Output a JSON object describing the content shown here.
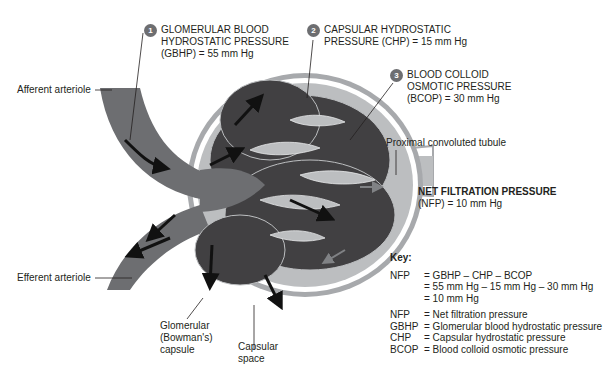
{
  "pressures": {
    "gbhp": {
      "number": "1",
      "lines": [
        "GLOMERULAR BLOOD",
        "HYDROSTATIC PRESSURE",
        "(GBHP) = 55 mm Hg"
      ]
    },
    "chp": {
      "number": "2",
      "lines": [
        "CAPSULAR HYDROSTATIC",
        "PRESSURE (CHP) = 15 mm Hg"
      ]
    },
    "bcop": {
      "number": "3",
      "lines": [
        "BLOOD COLLOID",
        "OSMOTIC PRESSURE",
        "(BCOP) = 30 mm Hg"
      ]
    }
  },
  "structures": {
    "afferent": "Afferent arteriole",
    "efferent": "Efferent arteriole",
    "pct": "Proximal convoluted tubule",
    "capsule": [
      "Glomerular",
      "(Bowman's)",
      "capsule"
    ],
    "space": [
      "Capsular",
      "space"
    ]
  },
  "nfp": {
    "title": "NET FILTRATION PRESSURE",
    "value": "(NFP) = 10 mm Hg"
  },
  "key": {
    "title": "Key:",
    "equation": [
      {
        "term": "NFP",
        "expr": "= GBHP – CHP – BCOP"
      },
      {
        "term": "",
        "expr": "= 55 mm Hg – 15 mm Hg – 30 mm Hg"
      },
      {
        "term": "",
        "expr": "= 10 mm Hg"
      }
    ],
    "definitions": [
      {
        "term": "NFP",
        "def": "= Net filtration pressure"
      },
      {
        "term": "GBHP",
        "def": "= Glomerular blood hydrostatic pressure"
      },
      {
        "term": "CHP",
        "def": "= Capsular hydrostatic pressure"
      },
      {
        "term": "BCOP",
        "def": "= Blood colloid osmotic pressure"
      }
    ]
  },
  "colors": {
    "vessel": "#6d6e71",
    "glomerulus": "#414042",
    "capsule_wall": "#a7a9ac",
    "capsular_space": "#bcbec0",
    "badge": "#6d6e71"
  }
}
